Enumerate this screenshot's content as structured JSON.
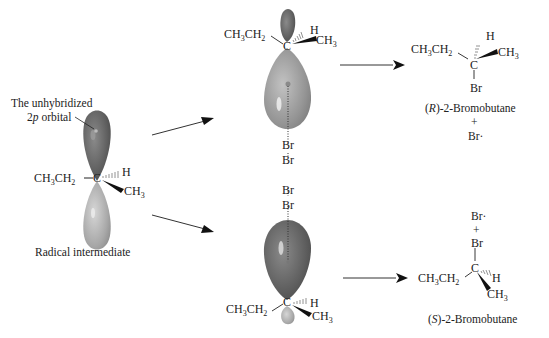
{
  "radical": {
    "orbital_label_line1": "The unhybridized",
    "orbital_label_line2_pre": "2",
    "orbital_label_line2_italic": "p",
    "orbital_label_line2_post": " orbital",
    "left_group": "CH3CH2",
    "center_atom": "C",
    "hash_group": "H",
    "wedge_group": "CH3",
    "caption": "Radical intermediate"
  },
  "top_attack": {
    "left_group": "CH3CH2",
    "center_atom": "C",
    "hash_group": "H",
    "wedge_group": "CH3",
    "br_near": "Br",
    "br_far": "Br"
  },
  "bottom_attack": {
    "left_group": "CH3CH2",
    "center_atom": "C",
    "hash_group": "H",
    "wedge_group": "CH3",
    "br_near": "Br",
    "br_far": "Br"
  },
  "product_r": {
    "left_group": "CH3CH2",
    "center_atom": "C",
    "hash_group": "H",
    "wedge_group": "CH3",
    "bottom_group": "Br",
    "name_prefix": "(",
    "name_config": "R",
    "name_suffix": ")-2-Bromobutane",
    "plus": "+",
    "byproduct": "Br·"
  },
  "product_s": {
    "left_group": "CH3CH2",
    "center_atom": "C",
    "hash_group": "H",
    "wedge_group": "CH3",
    "top_group": "Br",
    "name_prefix": "(",
    "name_config": "S",
    "name_suffix": ")-2-Bromobutane",
    "plus": "+",
    "byproduct": "Br·"
  },
  "colors": {
    "orbital_dark": "#6e6e6e",
    "orbital_light": "#b4b4b4",
    "text": "#222222",
    "arrow": "#111111"
  }
}
